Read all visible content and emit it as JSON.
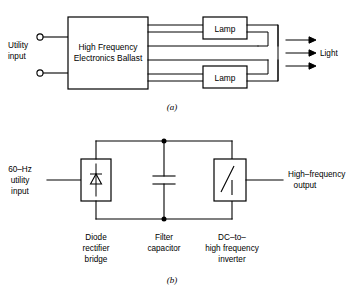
{
  "figure": {
    "panel_a": {
      "caption": "(a)",
      "input_label_line1": "Utility",
      "input_label_line2": "input",
      "ballast_label_line1": "High Frequency",
      "ballast_label_line2": "Electronics Ballast",
      "lamp_top_label": "Lamp",
      "lamp_bottom_label": "Lamp",
      "output_label": "Light",
      "terminal_count": 2,
      "ballast_output_line_count": 6,
      "light_arrow_count": 3
    },
    "panel_b": {
      "caption": "(b)",
      "input_label_line1": "60–Hz",
      "input_label_line2": "utility",
      "input_label_line3": "input",
      "output_label_line1": "High–frequency",
      "output_label_line2": "output",
      "block1_label_line1": "Diode",
      "block1_label_line2": "rectifier",
      "block1_label_line3": "bridge",
      "block1_symbol": "diode-icon",
      "block2_label_line1": "Filter",
      "block2_label_line2": "capacitor",
      "block2_symbol": "capacitor-icon",
      "block3_label_line1": "DC–to–",
      "block3_label_line2": "high frequency",
      "block3_label_line3": "inverter",
      "block3_symbol": "inverter-switch-icon",
      "junction_dot_count": 2
    },
    "colors": {
      "background": "#ffffff",
      "line": "#000000",
      "text": "#000000"
    }
  }
}
